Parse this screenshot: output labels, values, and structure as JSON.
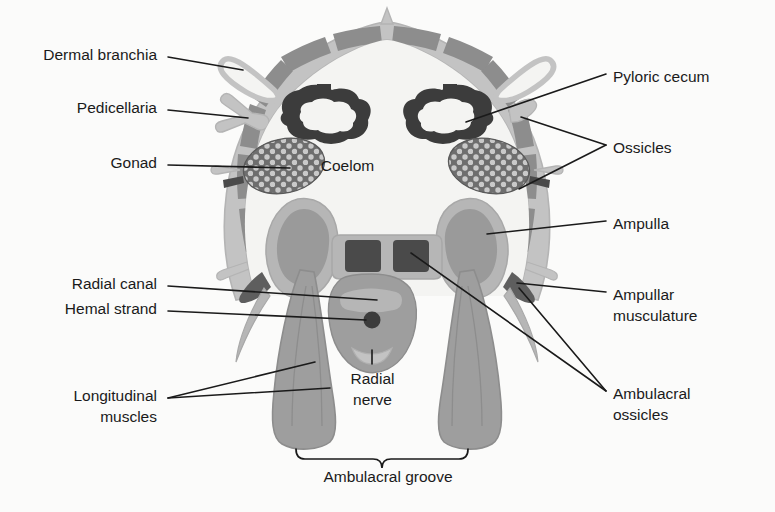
{
  "figure": {
    "type": "anatomical-cross-section",
    "background_color": "#fbfbfa",
    "text_color": "#1a1a1a",
    "palette": {
      "body_wall_light": "#c3c3c3",
      "ossicle_gray": "#8d8d8d",
      "coelom_white": "#f4f4f2",
      "gonad_dark": "#6e6e6e",
      "gonad_dot": "#c8c8c8",
      "pyloric_dark": "#3c3c3c",
      "pyloric_lumen": "#f4f4f2",
      "ampulla_light": "#b6b6b6",
      "ampulla_mid": "#9a9a9a",
      "muscle_gray": "#9e9e9e",
      "muscle_dark": "#5e5e5e",
      "ambulacral_ossicle": "#4a4a4a",
      "leader_line": "#1a1a1a"
    }
  },
  "labels": {
    "left": [
      {
        "id": "dermal-branchia",
        "text": "Dermal branchia",
        "x": 157,
        "y": 52,
        "lines": 1
      },
      {
        "id": "pedicellaria",
        "text": "Pedicellaria",
        "x": 157,
        "y": 104,
        "lines": 1
      },
      {
        "id": "gonad",
        "text": "Gonad",
        "x": 157,
        "y": 160,
        "lines": 1
      },
      {
        "id": "radial-canal",
        "text": "Radial canal",
        "x": 157,
        "y": 280,
        "lines": 1
      },
      {
        "id": "hemal-strand",
        "text": "Hemal strand",
        "x": 157,
        "y": 305,
        "lines": 1
      }
    ],
    "left_multiline": [
      {
        "id": "longitudinal-muscles",
        "line1": "Longitudinal",
        "line2": "muscles",
        "x": 157,
        "y": 378
      }
    ],
    "right": [
      {
        "id": "pyloric-cecum",
        "text": "Pyloric cecum",
        "x": 613,
        "y": 68,
        "lines": 1
      },
      {
        "id": "ossicles",
        "text": "Ossicles",
        "x": 613,
        "y": 139,
        "lines": 1
      },
      {
        "id": "ampulla",
        "text": "Ampulla",
        "x": 613,
        "y": 215,
        "lines": 1
      }
    ],
    "right_multiline": [
      {
        "id": "ampullar-musculature",
        "line1": "Ampullar",
        "line2": "musculature",
        "x": 613,
        "y": 286
      },
      {
        "id": "ambulacral-ossicles",
        "line1": "Ambulacral",
        "line2": "ossicles",
        "x": 613,
        "y": 385
      }
    ],
    "interior": [
      {
        "id": "coelom",
        "text": "Coelom",
        "x": 347,
        "y": 163
      }
    ],
    "center_multiline": [
      {
        "id": "radial-nerve",
        "line1": "Radial",
        "line2": "nerve",
        "x": 355,
        "y": 364
      }
    ],
    "bracket": [
      {
        "id": "ambulacral-groove",
        "text": "Ambulacral groove",
        "x": 288,
        "y": 467
      }
    ]
  },
  "structures": [
    {
      "id": "body-wall",
      "name": "body wall with ossicles"
    },
    {
      "id": "dermal-branchia",
      "name": "dermal branchia (papula)"
    },
    {
      "id": "pedicellaria",
      "name": "pedicellaria"
    },
    {
      "id": "gonad-left",
      "name": "gonad (left)"
    },
    {
      "id": "gonad-right",
      "name": "gonad (right)"
    },
    {
      "id": "pyloric-cecum-left",
      "name": "pyloric cecum (left)"
    },
    {
      "id": "pyloric-cecum-right",
      "name": "pyloric cecum (right)"
    },
    {
      "id": "coelom",
      "name": "coelomic cavity"
    },
    {
      "id": "ampulla-left",
      "name": "ampulla (left)"
    },
    {
      "id": "ampulla-right",
      "name": "ampulla (right)"
    },
    {
      "id": "ambulacral-ossicles",
      "name": "paired ambulacral ossicles"
    },
    {
      "id": "radial-canal",
      "name": "radial water canal"
    },
    {
      "id": "hemal-strand",
      "name": "hemal strand"
    },
    {
      "id": "radial-nerve",
      "name": "radial nerve cord"
    },
    {
      "id": "tube-feet",
      "name": "tube feet / podia"
    },
    {
      "id": "ambulacral-groove",
      "name": "ambulacral groove"
    }
  ]
}
